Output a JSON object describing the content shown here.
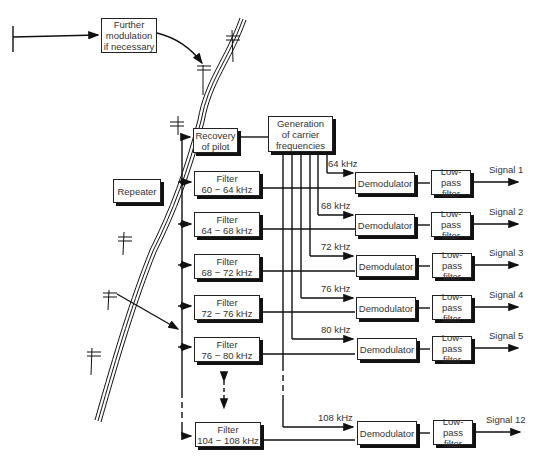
{
  "diagram": {
    "further_modulation": {
      "line1": "Further",
      "line2": "modulation",
      "line3": "if necessary"
    },
    "repeater": "Repeater",
    "recovery_of_pilot": {
      "line1": "Recovery",
      "line2": "of pilot"
    },
    "carrier_generation": {
      "line1": "Generation",
      "line2": "of carrier",
      "line3": "frequencies"
    },
    "filters": [
      {
        "title": "Filter",
        "range": "60 − 64 kHz"
      },
      {
        "title": "Filter",
        "range": "64 − 68 kHz"
      },
      {
        "title": "Filter",
        "range": "68 − 72 kHz"
      },
      {
        "title": "Filter",
        "range": "72 − 76 kHz"
      },
      {
        "title": "Filter",
        "range": "76 − 80 kHz"
      },
      {
        "title": "Filter",
        "range": "104 − 108 kHz"
      }
    ],
    "carriers": [
      "64 kHz",
      "68 kHz",
      "72 kHz",
      "76 kHz",
      "80 kHz",
      "108 kHz"
    ],
    "demodulator": "Demodulator",
    "lowpass": {
      "line1": "Low-pass",
      "line2": "filter"
    },
    "signals": [
      "Signal 1",
      "Signal 2",
      "Signal 3",
      "Signal 4",
      "Signal 5",
      "Signal 12"
    ]
  }
}
